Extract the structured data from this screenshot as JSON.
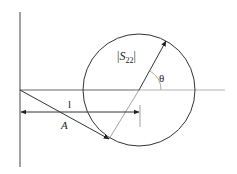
{
  "diagram": {
    "labels": {
      "s22_prefix": "|",
      "s22_main": "S",
      "s22_sub": "22",
      "s22_suffix": "|",
      "theta": "θ",
      "length": "l",
      "vector": "A"
    },
    "colors": {
      "line": "#333333",
      "light_line": "#9a9a9a",
      "background": "#ffffff"
    },
    "geometry": {
      "vertical_axis": {
        "x": 20,
        "y1": 12,
        "y2": 167
      },
      "horizontal_axis": {
        "y": 90,
        "x1": 20,
        "x2": 225
      },
      "circle": {
        "cx": 139,
        "cy": 90,
        "r": 56
      },
      "radius_vector": {
        "x1": 109,
        "y1": 139,
        "x2": 166,
        "y2": 41
      },
      "vector_A": {
        "x1": 20,
        "y1": 90,
        "x2": 109,
        "y2": 139
      },
      "dimension_l": {
        "y": 112,
        "x1": 20,
        "x2": 140
      },
      "dimension_tick": {
        "x": 140,
        "y1": 105,
        "y2": 127
      }
    }
  }
}
